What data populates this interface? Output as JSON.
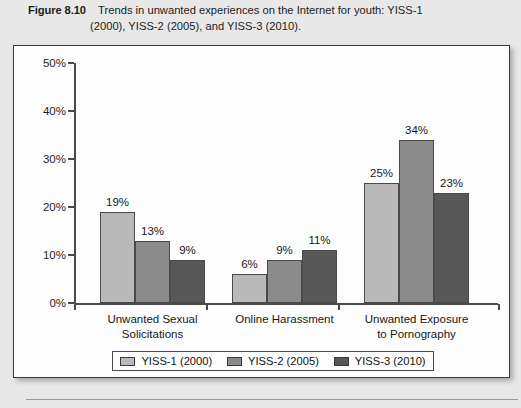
{
  "caption": {
    "figure_label": "Figure 8.10",
    "text_line1": "Trends in unwanted experiences on the Internet for youth: YISS-1",
    "text_line2": "(2000), YISS-2 (2005), and YISS-3 (2010)."
  },
  "chart_data": {
    "type": "bar",
    "title": "",
    "xlabel": "",
    "ylabel": "",
    "ylim": [
      0,
      50
    ],
    "grid": false,
    "legend_position": "bottom",
    "categories": [
      "Unwanted Sexual Solicitations",
      "Online Harassment",
      "Unwanted Exposure to Pornography"
    ],
    "category_lines": [
      [
        "Unwanted Sexual",
        "Solicitations"
      ],
      [
        "Online Harassment",
        ""
      ],
      [
        "Unwanted Exposure",
        "to Pornography"
      ]
    ],
    "series": [
      {
        "name": "YISS-1 (2000)",
        "color": "#b9b9b9",
        "values": [
          19,
          6,
          25
        ],
        "labels": [
          "19%",
          "6%",
          "25%"
        ]
      },
      {
        "name": "YISS-2 (2005)",
        "color": "#8b8b8b",
        "values": [
          13,
          9,
          34
        ],
        "labels": [
          "13%",
          "9%",
          "34%"
        ]
      },
      {
        "name": "YISS-3 (2010)",
        "color": "#585858",
        "values": [
          9,
          11,
          23
        ],
        "labels": [
          "9%",
          "11%",
          "23%"
        ]
      }
    ],
    "y_ticks": [
      0,
      10,
      20,
      30,
      40,
      50
    ],
    "y_tick_labels": [
      "0%",
      "10%",
      "20%",
      "30%",
      "40%",
      "50%"
    ]
  }
}
